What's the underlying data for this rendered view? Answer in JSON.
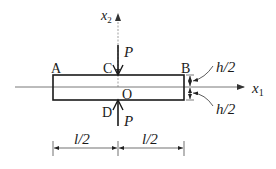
{
  "diagram": {
    "points": {
      "A": "A",
      "B": "B",
      "C": "C",
      "D": "D",
      "O": "O"
    },
    "axes": {
      "x1_base": "x",
      "x1_sub": "1",
      "x2_base": "x",
      "x2_sub": "2"
    },
    "loads": {
      "top": "P",
      "bottom": "P"
    },
    "dimensions": {
      "half_height_top": "h/2",
      "half_height_bottom": "h/2",
      "half_length_left": "l/2",
      "half_length_right": "l/2"
    },
    "colors": {
      "line": "#1a1a1a",
      "axis": "#555555"
    }
  }
}
